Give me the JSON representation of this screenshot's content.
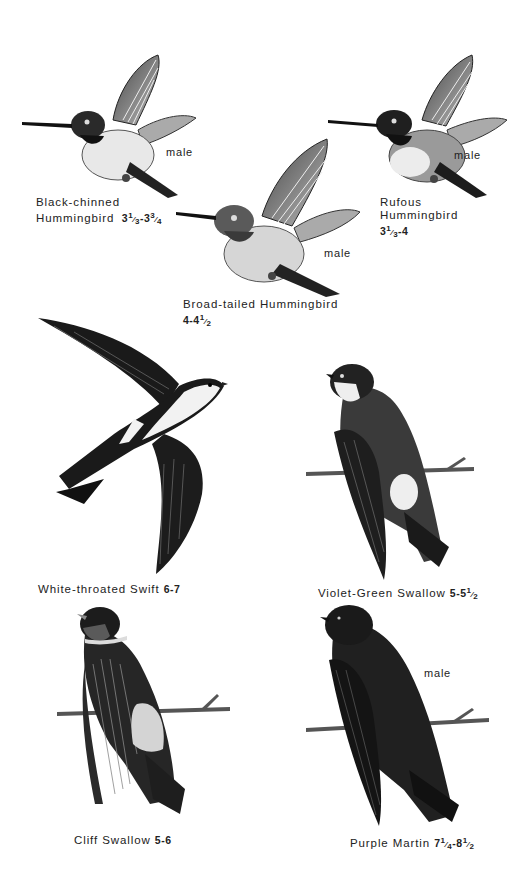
{
  "plate": {
    "birds": [
      {
        "id": "black-chinned",
        "name_line1": "Black-chinned",
        "name_line2": "Hummingbird",
        "size": "3⅓-3¾",
        "size_parts": [
          "3",
          "1",
          "3",
          "-3",
          "3",
          "4"
        ],
        "sex": "male"
      },
      {
        "id": "rufous",
        "name_line1": "Rufous",
        "name_line2": "Hummingbird",
        "size": "3⅓-4",
        "size_parts": [
          "3",
          "1",
          "3",
          "-4"
        ],
        "sex": "male"
      },
      {
        "id": "broad-tailed",
        "name_line1": "Broad-tailed Hummingbird",
        "size": "4-4½",
        "size_parts": [
          "4-4",
          "1",
          "2"
        ],
        "sex": "male"
      },
      {
        "id": "white-throated-swift",
        "name_line1": "White-throated Swift",
        "size": "6-7"
      },
      {
        "id": "violet-green-swallow",
        "name_line1": "Violet-Green Swallow",
        "size": "5-5½",
        "size_parts": [
          "5-5",
          "1",
          "2"
        ]
      },
      {
        "id": "cliff-swallow",
        "name_line1": "Cliff Swallow",
        "size": "5-6"
      },
      {
        "id": "purple-martin",
        "name_line1": "Purple Martin",
        "size": "7¼-8½",
        "size_parts": [
          "7",
          "1",
          "4",
          "-8",
          "1",
          "2"
        ],
        "sex": "male"
      }
    ]
  },
  "colors": {
    "ink": "#1a1a1a",
    "paper": "#ffffff",
    "mid": "#6e6e6e",
    "light": "#d8d8d8"
  }
}
